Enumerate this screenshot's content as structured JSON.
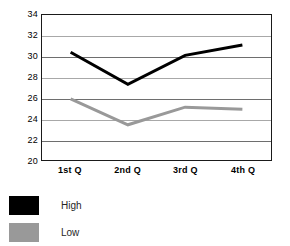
{
  "chart_data": {
    "type": "line",
    "title": "",
    "subtitle": "",
    "xlabel": "",
    "ylabel": "",
    "categories": [
      "1st Q",
      "2nd Q",
      "3rd Q",
      "4th Q"
    ],
    "series": [
      {
        "name": "High",
        "color": "#000000",
        "values": [
          30.4,
          27.3,
          30.1,
          31.1
        ]
      },
      {
        "name": "Low",
        "color": "#999999",
        "values": [
          25.9,
          23.4,
          25.1,
          24.9
        ]
      }
    ],
    "ylim": [
      20,
      34
    ],
    "yticks": [
      34,
      32,
      30,
      28,
      26,
      24,
      22,
      20
    ],
    "ytick_labels": [
      "34",
      "32",
      "30",
      "28",
      "26",
      "24",
      "22",
      "20"
    ],
    "grid": true,
    "grid_axis": "y",
    "legend_position": "below-left",
    "plot_background": "#ffffff",
    "frame_color": "#1a1a1a",
    "gridline_color": "#6e6e6e"
  },
  "legend": {
    "items": [
      {
        "label": "High",
        "color": "#000000"
      },
      {
        "label": "Low",
        "color": "#999999"
      }
    ]
  }
}
